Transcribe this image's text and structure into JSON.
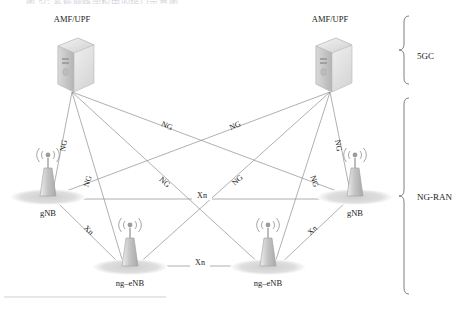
{
  "figure": {
    "top_caption": "图 5G 系统网络架构中的接口示意图",
    "groups": [
      {
        "id": "5gc",
        "label": "5GC"
      },
      {
        "id": "ng-ran",
        "label": "NG-RAN"
      }
    ]
  },
  "nodes": [
    {
      "id": "amf-left",
      "type": "server",
      "label": "AMF/UPF",
      "x": 72,
      "y": 62,
      "label_x": 72,
      "label_y": 20
    },
    {
      "id": "amf-right",
      "type": "server",
      "label": "AMF/UPF",
      "x": 330,
      "y": 62,
      "label_x": 330,
      "label_y": 20
    },
    {
      "id": "gnb-left",
      "type": "antenna",
      "label": "gNB",
      "x": 48,
      "y": 188,
      "label_x": 48,
      "label_y": 214
    },
    {
      "id": "gnb-right",
      "type": "antenna",
      "label": "gNB",
      "x": 355,
      "y": 188,
      "label_x": 355,
      "label_y": 214
    },
    {
      "id": "ngenb-left",
      "type": "antenna",
      "label": "ng–eNB",
      "x": 130,
      "y": 258,
      "label_x": 130,
      "label_y": 284
    },
    {
      "id": "ngenb-right",
      "type": "antenna",
      "label": "ng–eNB",
      "x": 268,
      "y": 258,
      "label_x": 268,
      "label_y": 284
    }
  ],
  "edges": [
    {
      "id": "e1",
      "from": "amf-left",
      "to": "gnb-left",
      "label": "NG",
      "x1": 72,
      "y1": 92,
      "x2": 52,
      "y2": 196
    },
    {
      "id": "e2",
      "from": "amf-left",
      "to": "ngenb-left",
      "label": "NG",
      "x1": 72,
      "y1": 92,
      "x2": 124,
      "y2": 266
    },
    {
      "id": "e3",
      "from": "amf-left",
      "to": "ngenb-right",
      "label": "NG",
      "x1": 72,
      "y1": 92,
      "x2": 262,
      "y2": 266
    },
    {
      "id": "e4",
      "from": "amf-left",
      "to": "gnb-right",
      "label": "NG",
      "x1": 72,
      "y1": 92,
      "x2": 350,
      "y2": 196
    },
    {
      "id": "e5",
      "from": "amf-right",
      "to": "gnb-right",
      "label": "NG",
      "x1": 330,
      "y1": 92,
      "x2": 351,
      "y2": 196
    },
    {
      "id": "e6",
      "from": "amf-right",
      "to": "ngenb-right",
      "label": "NG",
      "x1": 330,
      "y1": 92,
      "x2": 274,
      "y2": 266
    },
    {
      "id": "e7",
      "from": "amf-right",
      "to": "ngenb-left",
      "label": "NG",
      "x1": 330,
      "y1": 92,
      "x2": 136,
      "y2": 266
    },
    {
      "id": "e8",
      "from": "amf-right",
      "to": "gnb-left",
      "label": "NG",
      "x1": 330,
      "y1": 92,
      "x2": 53,
      "y2": 196
    },
    {
      "id": "x1",
      "from": "gnb-left",
      "to": "gnb-right",
      "label": "Xn",
      "x1": 60,
      "y1": 199,
      "x2": 345,
      "y2": 199
    },
    {
      "id": "x2",
      "from": "ngenb-left",
      "to": "ngenb-right",
      "label": "Xn",
      "x1": 148,
      "y1": 266,
      "x2": 252,
      "y2": 266
    },
    {
      "id": "x3",
      "from": "gnb-left",
      "to": "ngenb-left",
      "label": "Xn",
      "x1": 56,
      "y1": 200,
      "x2": 122,
      "y2": 266
    },
    {
      "id": "x4",
      "from": "gnb-right",
      "to": "ngenb-right",
      "label": "Xn",
      "x1": 347,
      "y1": 200,
      "x2": 278,
      "y2": 266
    }
  ],
  "edge_labels": [
    {
      "id": "ng-a",
      "text": "NG",
      "x": 66,
      "y": 146,
      "rot": -80
    },
    {
      "id": "ng-b",
      "text": "NG",
      "x": 90,
      "y": 182,
      "rot": -72
    },
    {
      "id": "ng-c",
      "text": "NG",
      "x": 166,
      "y": 128,
      "rot": 23
    },
    {
      "id": "ng-d",
      "text": "NG",
      "x": 163,
      "y": 184,
      "rot": 42
    },
    {
      "id": "ng-e",
      "text": "NG",
      "x": 239,
      "y": 182,
      "rot": -42
    },
    {
      "id": "ng-f",
      "text": "NG",
      "x": 236,
      "y": 128,
      "rot": -23
    },
    {
      "id": "ng-g",
      "text": "NG",
      "x": 312,
      "y": 182,
      "rot": 72
    },
    {
      "id": "ng-h",
      "text": "NG",
      "x": 336,
      "y": 146,
      "rot": 80
    },
    {
      "id": "xn-h1",
      "text": "Xn",
      "x": 202,
      "y": 196,
      "rot": 0
    },
    {
      "id": "xn-h2",
      "text": "Xn",
      "x": 200,
      "y": 263,
      "rot": 0
    },
    {
      "id": "xn-l",
      "text": "Xn",
      "x": 87,
      "y": 232,
      "rot": 44
    },
    {
      "id": "xn-r",
      "text": "Xn",
      "x": 314,
      "y": 232,
      "rot": -44
    }
  ],
  "icons": {
    "server": "server-icon",
    "antenna": "antenna-tower-icon",
    "signal": "signal-waves-icon",
    "shadow": "ground-shadow-icon",
    "brace": "curly-brace-icon"
  },
  "colors": {
    "line": "#8e8e8e",
    "text": "#1b1b1b",
    "icon_light": "#e8e8e8",
    "icon_mid": "#c9c9c9",
    "icon_dark": "#a8a8a8",
    "shadow": "#dcdcdc",
    "background": "#ffffff"
  }
}
